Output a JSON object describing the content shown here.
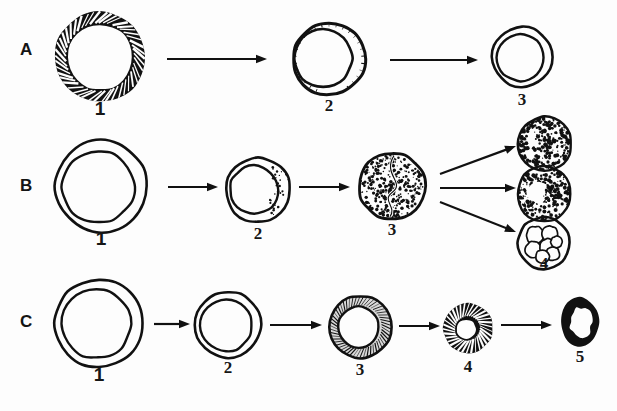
{
  "figure": {
    "width": 617,
    "height": 411,
    "background": "#fdfdfd",
    "ink": "#111111"
  },
  "rows": [
    {
      "label": "A",
      "label_x": 20,
      "label_y": 50,
      "stages": [
        {
          "number": "1",
          "name": "thick-hatched-ring-cell",
          "cx": 100,
          "cy": 57,
          "r": 45,
          "style": "thick-black-hatched-ring",
          "num_x": 80,
          "num_y": 98
        },
        {
          "number": "2",
          "name": "crescent-rim-cell",
          "cx": 329,
          "cy": 59,
          "r": 36,
          "style": "crescent-offset-ring",
          "num_x": 309,
          "num_y": 96
        },
        {
          "number": "3",
          "name": "plain-double-ring-cell",
          "cx": 522,
          "cy": 57,
          "r": 30,
          "style": "plain-double-ring",
          "num_x": 502,
          "num_y": 90
        }
      ],
      "arrows": [
        {
          "name": "arrow-a1-a2",
          "x1": 167,
          "y1": 59,
          "x2": 267,
          "y2": 59
        },
        {
          "name": "arrow-a2-a3",
          "x1": 390,
          "y1": 60,
          "x2": 478,
          "y2": 60
        }
      ]
    },
    {
      "label": "B",
      "label_x": 20,
      "label_y": 186,
      "stages": [
        {
          "number": "1",
          "name": "plain-thin-ring-cell",
          "cx": 101,
          "cy": 186,
          "r": 46,
          "style": "plain-double-ring",
          "num_x": 81,
          "num_y": 228
        },
        {
          "number": "2",
          "name": "partial-stipple-cell",
          "cx": 258,
          "cy": 190,
          "r": 32,
          "style": "partial-stipple-ring",
          "num_x": 238,
          "num_y": 224
        },
        {
          "number": "3",
          "name": "dense-stipple-bilobed-cell",
          "cx": 392,
          "cy": 186,
          "r": 33,
          "style": "dense-stipple-bilobed",
          "num_x": 372,
          "num_y": 220
        },
        {
          "number": "4",
          "name": "outcome-dense-stipple-cell",
          "cx": 544,
          "cy": 144,
          "r": 27,
          "style": "dense-stipple",
          "num_x": null,
          "num_y": null
        },
        {
          "number": "",
          "name": "outcome-stipple-clear-patch-cell",
          "cx": 544,
          "cy": 194,
          "r": 27,
          "style": "stipple-with-clear-patch",
          "num_x": null,
          "num_y": null
        },
        {
          "number": "4",
          "name": "outcome-vesicular-cell",
          "cx": 544,
          "cy": 243,
          "r": 26,
          "style": "vesicular-bubbles",
          "num_x": 524,
          "num_y": 254
        }
      ],
      "arrows": [
        {
          "name": "arrow-b1-b2",
          "x1": 168,
          "y1": 187,
          "x2": 218,
          "y2": 187
        },
        {
          "name": "arrow-b2-b3",
          "x1": 299,
          "y1": 187,
          "x2": 350,
          "y2": 187
        },
        {
          "name": "arrow-b3-outcome1",
          "x1": 440,
          "y1": 174,
          "x2": 516,
          "y2": 146
        },
        {
          "name": "arrow-b3-outcome2",
          "x1": 440,
          "y1": 188,
          "x2": 516,
          "y2": 188
        },
        {
          "name": "arrow-b3-outcome3",
          "x1": 440,
          "y1": 202,
          "x2": 516,
          "y2": 232
        }
      ]
    },
    {
      "label": "C",
      "label_x": 20,
      "label_y": 322,
      "stages": [
        {
          "number": "1",
          "name": "plain-large-ring-cell",
          "cx": 99,
          "cy": 323,
          "r": 44,
          "style": "plain-double-ring",
          "num_x": 79,
          "num_y": 364
        },
        {
          "number": "2",
          "name": "plain-medium-ring-cell",
          "cx": 228,
          "cy": 325,
          "r": 33,
          "style": "plain-double-ring",
          "num_x": 208,
          "num_y": 358
        },
        {
          "number": "3",
          "name": "shaded-ring-cell",
          "cx": 360,
          "cy": 327,
          "r": 31,
          "style": "hatched-grey-ring",
          "num_x": 340,
          "num_y": 360
        },
        {
          "number": "4",
          "name": "dark-thick-ring-cell",
          "cx": 468,
          "cy": 328,
          "r": 25,
          "style": "dark-thick-hatched-ring",
          "num_x": 448,
          "num_y": 357
        },
        {
          "number": "5",
          "name": "small-dark-oval-cell",
          "cx": 580,
          "cy": 322,
          "r": 19,
          "style": "small-dark-oval",
          "num_x": 560,
          "num_y": 347
        }
      ],
      "arrows": [
        {
          "name": "arrow-c1-c2",
          "x1": 154,
          "y1": 324,
          "x2": 190,
          "y2": 324
        },
        {
          "name": "arrow-c2-c3",
          "x1": 270,
          "y1": 325,
          "x2": 322,
          "y2": 325
        },
        {
          "name": "arrow-c3-c4",
          "x1": 399,
          "y1": 326,
          "x2": 440,
          "y2": 326
        },
        {
          "name": "arrow-c4-c5",
          "x1": 501,
          "y1": 325,
          "x2": 552,
          "y2": 325
        }
      ]
    }
  ]
}
